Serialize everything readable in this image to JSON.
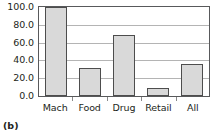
{
  "caption": "(b)",
  "chart_data": {
    "type": "bar",
    "title": "",
    "xlabel": "",
    "ylabel": "",
    "categories": [
      "Mach",
      "Food",
      "Drug",
      "Retail",
      "All"
    ],
    "values": [
      100.0,
      31.0,
      69.0,
      9.0,
      36.0
    ],
    "ylim": [
      0.0,
      100.0
    ],
    "yticks": [
      0.0,
      20.0,
      40.0,
      60.0,
      80.0,
      100.0
    ],
    "ytick_labels": [
      "0.0",
      "20.0",
      "40.0",
      "60.0",
      "80.0",
      "100.0"
    ],
    "grid": true,
    "legend": false,
    "bar_fill_color": "#d9d9d9",
    "bar_edge_color": "#4d4d4d",
    "gridline_color": "#b4b4b4",
    "frame_color": "#58595b"
  }
}
